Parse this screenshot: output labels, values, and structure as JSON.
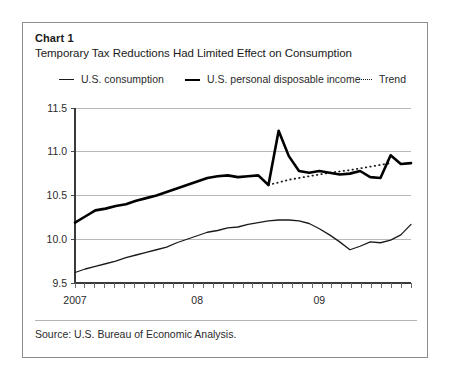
{
  "card": {
    "chart_label": "Chart 1",
    "title": "Temporary Tax Reductions Had Limited Effect on Consumption",
    "source": "Source: U.S. Bureau of Economic Analysis."
  },
  "legend": {
    "items": [
      {
        "label": "U.S. consumption",
        "style": "thin-line",
        "color": "#1a1a1a"
      },
      {
        "label": "U.S. personal disposable income",
        "style": "thick-line",
        "color": "#000000"
      },
      {
        "label": "Trend",
        "style": "dotted-line",
        "color": "#1a1a1a"
      }
    ]
  },
  "chart_data": {
    "type": "line",
    "title": "Temporary Tax Reductions Had Limited Effect on Consumption",
    "xlabel": "",
    "ylabel": "",
    "ylim": [
      9.5,
      11.5
    ],
    "yticks": [
      "9.5",
      "10.0",
      "10.5",
      "11.0",
      "11.5"
    ],
    "ytick_values": [
      9.5,
      10.0,
      10.5,
      11.0,
      11.5
    ],
    "xticks": [
      "2007",
      "08",
      "09"
    ],
    "xtick_positions": [
      0,
      12,
      24
    ],
    "minor_tick_count": 34,
    "grid": "horizontal",
    "legend_position": "above-plot",
    "x": [
      0,
      1,
      2,
      3,
      4,
      5,
      6,
      7,
      8,
      9,
      10,
      11,
      12,
      13,
      14,
      15,
      16,
      17,
      18,
      19,
      20,
      21,
      22,
      23,
      24,
      25,
      26,
      27,
      28,
      29,
      30,
      31,
      32,
      33
    ],
    "series": [
      {
        "name": "U.S. personal disposable income",
        "values": [
          10.19,
          10.26,
          10.33,
          10.35,
          10.38,
          10.4,
          10.44,
          10.47,
          10.5,
          10.54,
          10.58,
          10.62,
          10.66,
          10.7,
          10.72,
          10.73,
          10.71,
          10.72,
          10.73,
          10.62,
          11.24,
          10.95,
          10.78,
          10.76,
          10.78,
          10.76,
          10.74,
          10.75,
          10.78,
          10.71,
          10.7,
          10.96,
          10.86,
          10.87
        ]
      },
      {
        "name": "U.S. consumption",
        "values": [
          9.62,
          9.66,
          9.69,
          9.72,
          9.75,
          9.79,
          9.82,
          9.85,
          9.88,
          9.91,
          9.96,
          10.0,
          10.04,
          10.08,
          10.1,
          10.13,
          10.14,
          10.17,
          10.19,
          10.21,
          10.22,
          10.22,
          10.21,
          10.18,
          10.12,
          10.05,
          9.97,
          9.88,
          9.92,
          9.97,
          9.96,
          9.99,
          10.05,
          10.17
        ]
      },
      {
        "name": "Trend",
        "style": "dotted",
        "x": [
          19,
          21,
          23,
          25,
          27,
          29,
          31
        ],
        "values": [
          10.62,
          10.68,
          10.72,
          10.76,
          10.79,
          10.83,
          10.87
        ]
      }
    ]
  }
}
